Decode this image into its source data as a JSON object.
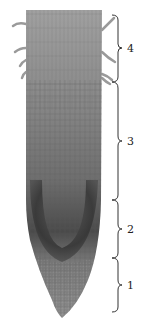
{
  "figure": {
    "zones": [
      {
        "label": "4",
        "top": 15,
        "bottom": 82
      },
      {
        "label": "3",
        "top": 82,
        "bottom": 200
      },
      {
        "label": "2",
        "top": 200,
        "bottom": 258
      },
      {
        "label": "1",
        "top": 258,
        "bottom": 312
      }
    ],
    "colors": {
      "tissue_light": "#a8a8a8",
      "tissue_mid": "#7a7a7a",
      "tissue_dark": "#3f3f3f",
      "bracket": "#333333"
    }
  }
}
